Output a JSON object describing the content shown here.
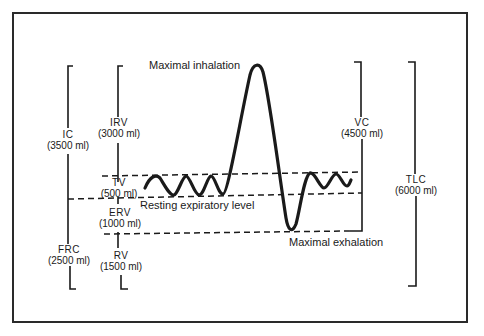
{
  "figure": {
    "annotations": {
      "max_inhalation": "Maximal inhalation",
      "resting_expiratory": "Resting expiratory level",
      "max_exhalation": "Maximal exhalation"
    },
    "capacities": {
      "ic": {
        "name": "IC",
        "value": "(3500 ml)"
      },
      "frc": {
        "name": "FRC",
        "value": "(2500 ml)"
      },
      "vc": {
        "name": "VC",
        "value": "(4500 ml)"
      },
      "tlc": {
        "name": "TLC",
        "value": "(6000 ml)"
      }
    },
    "volumes": {
      "irv": {
        "name": "IRV",
        "value": "(3000 ml)"
      },
      "tv": {
        "name": "TV",
        "value": "(500 ml)"
      },
      "erv": {
        "name": "ERV",
        "value": "(1000 ml)"
      },
      "rv": {
        "name": "RV",
        "value": "(1500 ml)"
      }
    },
    "colors": {
      "line": "#1a1a1a",
      "background": "#ffffff"
    }
  }
}
